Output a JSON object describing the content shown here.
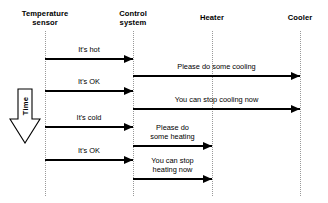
{
  "diagram": {
    "type": "uml-sequence-diagram",
    "width": 328,
    "height": 203,
    "background_color": "#ffffff",
    "line_color": "#000000",
    "lifeline_color": "#999999"
  },
  "lifelines": [
    {
      "id": "temperature-sensor",
      "name_line1": "Temperature",
      "name_line2": "sensor",
      "x": 45,
      "label_y": 9,
      "line_top": 31,
      "line_bottom": 196
    },
    {
      "id": "control-system",
      "name_line1": "Control",
      "name_line2": "system",
      "x": 133,
      "label_y": 9,
      "line_top": 31,
      "line_bottom": 196
    },
    {
      "id": "heater",
      "name_line1": "Heater",
      "name_line2": "",
      "x": 212,
      "label_y": 13,
      "line_top": 31,
      "line_bottom": 196
    },
    {
      "id": "cooler",
      "name_line1": "Cooler",
      "name_line2": "",
      "x": 300,
      "label_y": 13,
      "line_top": 31,
      "line_bottom": 196
    }
  ],
  "messages": [
    {
      "id": "its-hot",
      "label_line1": "It's hot",
      "label_line2": "",
      "from": 45,
      "to": 133,
      "y": 58,
      "label_y": 46
    },
    {
      "id": "please-do-some-cooling",
      "label_line1": "Please do some cooling",
      "label_line2": "",
      "from": 133,
      "to": 300,
      "y": 75,
      "label_y": 63
    },
    {
      "id": "its-ok-1",
      "label_line1": "It's OK",
      "label_line2": "",
      "from": 45,
      "to": 133,
      "y": 90,
      "label_y": 78
    },
    {
      "id": "you-can-stop-cooling-now",
      "label_line1": "You can stop cooling now",
      "label_line2": "",
      "from": 133,
      "to": 300,
      "y": 108,
      "label_y": 96
    },
    {
      "id": "its-cold",
      "label_line1": "It's cold",
      "label_line2": "",
      "from": 45,
      "to": 133,
      "y": 126,
      "label_y": 114
    },
    {
      "id": "please-do-some-heating",
      "label_line1": "Please do",
      "label_line2": "some heating",
      "from": 133,
      "to": 212,
      "y": 145,
      "label_y": 124
    },
    {
      "id": "its-ok-2",
      "label_line1": "It's OK",
      "label_line2": "",
      "from": 45,
      "to": 133,
      "y": 159,
      "label_y": 147
    },
    {
      "id": "you-can-stop-heating-now",
      "label_line1": "You can stop",
      "label_line2": "heating now",
      "from": 133,
      "to": 212,
      "y": 178,
      "label_y": 157
    }
  ],
  "time_arrow": {
    "label": "Time",
    "x": 9,
    "y": 88,
    "width": 32,
    "height": 56,
    "text_center_x": 25,
    "text_center_y": 106,
    "direction": "down"
  }
}
